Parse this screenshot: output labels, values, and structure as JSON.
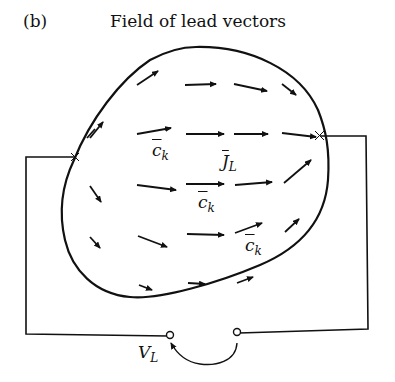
{
  "figure": {
    "panel_label": "(b)",
    "title": "Field of lead vectors",
    "labels": {
      "ck": "c",
      "ck_sub": "k",
      "jl": "J",
      "jl_sub": "L",
      "vl": "V",
      "vl_sub": "L"
    },
    "colors": {
      "ink": "#111111",
      "background": "#ffffff"
    }
  }
}
